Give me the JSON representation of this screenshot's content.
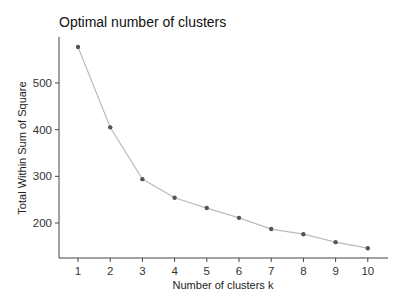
{
  "chart_data": {
    "type": "line",
    "title": "Optimal number of clusters",
    "xlabel": "Number of clusters k",
    "ylabel": "Total Within Sum of Square",
    "x": [
      1,
      2,
      3,
      4,
      5,
      6,
      7,
      8,
      9,
      10
    ],
    "categories": [
      "1",
      "2",
      "3",
      "4",
      "5",
      "6",
      "7",
      "8",
      "9",
      "10"
    ],
    "series": [
      {
        "name": "Total Within Sum of Square",
        "values": [
          577,
          405,
          294,
          254,
          232,
          211,
          187,
          176,
          159,
          146
        ],
        "line_color": "#bbbbbb",
        "point_color": "#555555"
      }
    ],
    "yticks": [
      200,
      300,
      400,
      500
    ],
    "ytick_labels": [
      "200",
      "300",
      "400",
      "500"
    ],
    "xticks": [
      1,
      2,
      3,
      4,
      5,
      6,
      7,
      8,
      9,
      10
    ],
    "ylim": [
      122,
      597
    ],
    "xlim": [
      0.4,
      10.6
    ],
    "grid": false,
    "legend": "none"
  }
}
